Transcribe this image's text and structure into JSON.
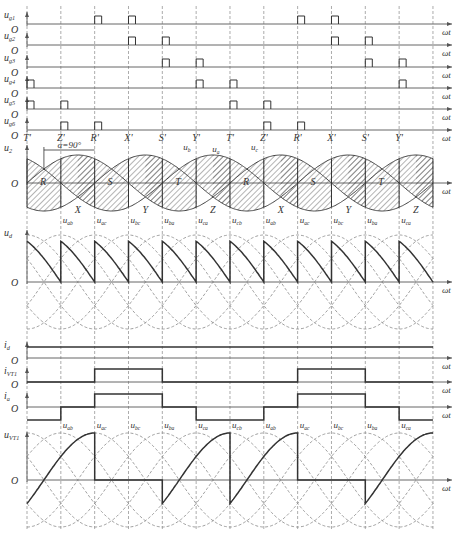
{
  "figure": {
    "alpha_label": "α=90°",
    "x_axis_label": "ωt",
    "origin_label": "O"
  },
  "gate_pulses": {
    "rows": [
      {
        "label": "u_g1",
        "name": "ug1",
        "pulses_at_step": [
          2,
          3,
          8,
          9
        ]
      },
      {
        "label": "u_g2",
        "name": "ug2",
        "pulses_at_step": [
          3,
          4,
          9,
          10
        ]
      },
      {
        "label": "u_g3",
        "name": "ug3",
        "pulses_at_step": [
          4,
          5,
          10,
          11
        ]
      },
      {
        "label": "u_g4",
        "name": "ug4",
        "pulses_at_step": [
          0,
          5,
          6,
          11
        ]
      },
      {
        "label": "u_g5",
        "name": "ug5",
        "pulses_at_step": [
          0,
          1,
          6,
          7
        ]
      },
      {
        "label": "u_g6",
        "name": "ug6",
        "pulses_at_step": [
          1,
          2,
          7,
          8
        ]
      }
    ],
    "markers": [
      "T'",
      "Z'",
      "R'",
      "X'",
      "S'",
      "Y'",
      "T'",
      "Z'",
      "R'",
      "X'",
      "S'",
      "Y'"
    ]
  },
  "phase_voltage_panel": {
    "y_label": "u_2",
    "curve_labels": [
      "u_a",
      "u_b",
      "u_c"
    ],
    "commutation_points_upper": [
      "R",
      "S",
      "T",
      "R",
      "S",
      "T"
    ],
    "commutation_points_lower": [
      "X",
      "Y",
      "Z",
      "X",
      "Y",
      "Z"
    ]
  },
  "line_voltage_labels": [
    "u_ab",
    "u_ac",
    "u_bc",
    "u_ba",
    "u_ca",
    "u_cb",
    "u_ab",
    "u_ac",
    "u_bc",
    "u_ba",
    "u_ca"
  ],
  "ud_panel": {
    "y_label": "u_d"
  },
  "id_panel": {
    "y_label": "i_d"
  },
  "ivt1_panel": {
    "y_label": "i_VT1"
  },
  "ia_panel": {
    "y_label": "i_a"
  },
  "uvt1_panel": {
    "y_label": "u_VT1"
  },
  "chart_data": {
    "type": "line",
    "xlabel": "ωt",
    "x_ticks_deg": [
      0,
      60,
      120,
      180,
      240,
      300,
      360,
      420,
      480,
      540,
      600,
      660,
      720
    ],
    "series": [
      {
        "name": "u_d",
        "description": "sawtooth from u_line(peak·0.866) down to -0.866, resets every 60°",
        "ud_avg": 0
      },
      {
        "name": "i_d",
        "description": "constant"
      },
      {
        "name": "i_VT1",
        "description": "high from 120° to 240°, 480° to 600°"
      },
      {
        "name": "i_a",
        "values_by_60deg": [
          -1,
          0,
          1,
          1,
          0,
          -1,
          -1,
          0,
          1,
          1,
          0,
          -1
        ]
      },
      {
        "name": "u_VT1",
        "description": "u_ab rising 0-120°, 0 for 120-240°, u_ac/u_ab... per conduction"
      }
    ],
    "grid": true
  }
}
